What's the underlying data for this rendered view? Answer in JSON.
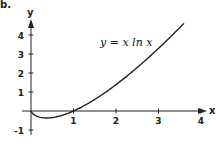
{
  "figure": {
    "label": "b."
  },
  "chart_data": {
    "type": "line",
    "title": "",
    "annotation": "y = x ln x",
    "xlabel": "x",
    "ylabel": "y",
    "xlim": [
      0,
      4.2
    ],
    "ylim": [
      -1.2,
      4.9
    ],
    "x_ticks": [
      1,
      2,
      3,
      4
    ],
    "x_tick_labels": [
      "1",
      "2",
      "3",
      "4"
    ],
    "y_ticks": [
      -1,
      1,
      2,
      3,
      4
    ],
    "y_tick_labels": [
      "-1",
      "1",
      "2",
      "3",
      "4"
    ],
    "grid": false,
    "legend": null,
    "series": [
      {
        "name": "y = x ln x",
        "function": "x*ln(x)",
        "domain": [
          0,
          3.6
        ],
        "x": [
          0.01,
          0.1,
          0.2,
          0.3,
          0.3679,
          0.5,
          0.75,
          1.0,
          1.5,
          2.0,
          2.5,
          3.0,
          3.3,
          3.6
        ],
        "y": [
          -0.05,
          -0.23,
          -0.32,
          -0.36,
          -0.37,
          -0.35,
          -0.22,
          0.0,
          0.61,
          1.39,
          2.29,
          3.3,
          3.94,
          4.61
        ]
      }
    ],
    "color": "#222222"
  }
}
